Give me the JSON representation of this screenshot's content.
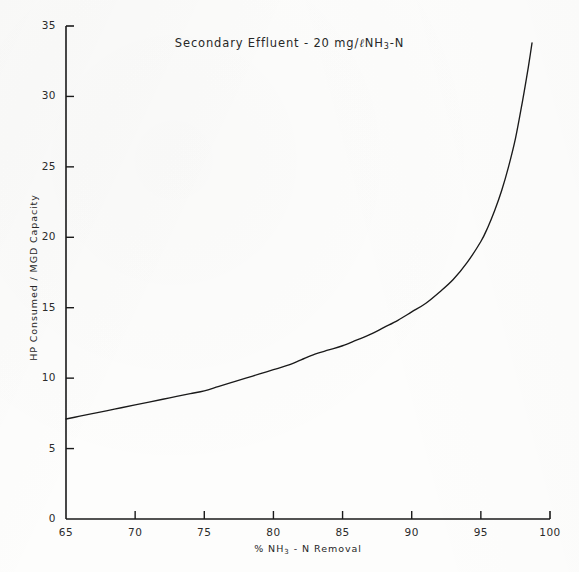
{
  "chart_data": {
    "type": "line",
    "title_parts": {
      "lead": "Secondary Effluent - 20 mg/",
      "script_l": "ℓ",
      "species": "NH",
      "species_sub": "3",
      "species_tail": "-N"
    },
    "xlabel": "% NH3 - N Removal",
    "xlabel_parts": {
      "lead": "% NH",
      "sub": "3",
      "tail": " - N Removal"
    },
    "ylabel": "HP Consumed / MGD Capacity",
    "xlim": [
      65,
      100
    ],
    "ylim": [
      0,
      35
    ],
    "xticks": [
      65,
      70,
      75,
      80,
      85,
      90,
      95,
      100
    ],
    "yticks": [
      0,
      5,
      10,
      15,
      20,
      25,
      30,
      35
    ],
    "xtick_labels": [
      "65",
      "70",
      "75",
      "80",
      "85",
      "90",
      "95",
      "100"
    ],
    "ytick_labels": [
      "0",
      "5",
      "10",
      "15",
      "20",
      "25",
      "30",
      "35"
    ],
    "grid": false,
    "legend": null,
    "series": [
      {
        "name": "HP Consumed per MGD Capacity",
        "x": [
          65.0,
          66.0,
          67.0,
          68.0,
          69.0,
          70.0,
          71.0,
          72.0,
          73.0,
          74.0,
          75.0,
          76.0,
          77.0,
          78.0,
          79.0,
          80.0,
          81.0,
          82.0,
          83.0,
          84.0,
          85.0,
          86.0,
          87.0,
          88.0,
          89.0,
          90.0,
          91.0,
          92.0,
          93.0,
          94.0,
          95.0,
          95.5,
          96.0,
          96.5,
          97.0,
          97.5,
          98.0,
          98.3,
          98.5,
          98.7
        ],
        "y": [
          7.1,
          7.3,
          7.5,
          7.7,
          7.9,
          8.1,
          8.3,
          8.5,
          8.7,
          8.9,
          9.1,
          9.4,
          9.7,
          10.0,
          10.3,
          10.6,
          10.9,
          11.3,
          11.7,
          12.0,
          12.3,
          12.7,
          13.1,
          13.6,
          14.1,
          14.7,
          15.3,
          16.1,
          17.0,
          18.2,
          19.7,
          20.7,
          21.9,
          23.3,
          25.0,
          27.0,
          29.6,
          31.3,
          32.5,
          33.8
        ]
      }
    ],
    "annotations": []
  },
  "style": {
    "line_color": "#1a1a1a",
    "axis_color": "#1a1a1a",
    "background": "#fdfdfc",
    "text_color": "#262626"
  }
}
